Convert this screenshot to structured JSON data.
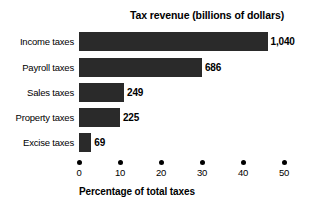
{
  "chart_data": {
    "type": "bar",
    "orientation": "horizontal",
    "title": "Tax revenue (billions of dollars)",
    "xlabel": "Percentage of total taxes",
    "ylabel": "",
    "categories": [
      "Income taxes",
      "Payroll taxes",
      "Sales taxes",
      "Property taxes",
      "Excise taxes"
    ],
    "values": [
      46,
      30,
      11,
      10,
      3
    ],
    "value_labels": [
      "1,040",
      "686",
      "249",
      "225",
      "69"
    ],
    "value_unit": "billions of dollars",
    "xlim": [
      0,
      53
    ],
    "xticks": [
      0,
      10,
      20,
      30,
      40,
      50
    ],
    "xtick_labels": [
      "0",
      "10",
      "20",
      "30",
      "40",
      "50"
    ],
    "grid": false,
    "legend": false,
    "bar_color": "#2a2a2a",
    "background_color": "#ffffff",
    "text_color": "#000000",
    "series": [
      {
        "name": "Tax revenue",
        "points": [
          {
            "category": "Income taxes",
            "percent": 46,
            "revenue_label": "1,040"
          },
          {
            "category": "Payroll taxes",
            "percent": 30,
            "revenue_label": "686"
          },
          {
            "category": "Sales taxes",
            "percent": 11,
            "revenue_label": "249"
          },
          {
            "category": "Property taxes",
            "percent": 10,
            "revenue_label": "225"
          },
          {
            "category": "Excise taxes",
            "percent": 3,
            "revenue_label": "69"
          }
        ]
      }
    ]
  }
}
